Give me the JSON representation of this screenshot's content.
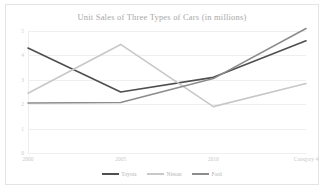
{
  "chart_data": {
    "type": "line",
    "title": "Unit Sales of Three Types of Cars (in millions)",
    "xlabel": "",
    "ylabel": "",
    "categories": [
      "2000",
      "2005",
      "2010",
      "Category 4"
    ],
    "yticks": [
      "0",
      "1",
      "2",
      "3",
      "4",
      "5"
    ],
    "ylim": [
      0,
      5
    ],
    "grid": true,
    "legend_position": "bottom",
    "series": [
      {
        "name": "Toyota",
        "color": "#4f4f4f",
        "values": [
          4.3,
          2.5,
          3.1,
          4.6
        ]
      },
      {
        "name": "Nissan",
        "color": "#c8c8c8",
        "values": [
          2.45,
          4.45,
          1.9,
          2.85
        ]
      },
      {
        "name": "Ford",
        "color": "#8c8c8c",
        "values": [
          2.05,
          2.07,
          3.05,
          5.1
        ]
      }
    ]
  },
  "colors": {
    "background": "#ffffff",
    "border": "#e4e4e4",
    "gridline": "#efefef",
    "title_text": "#a8a8a8",
    "tick_text": "#c9c9c9"
  }
}
